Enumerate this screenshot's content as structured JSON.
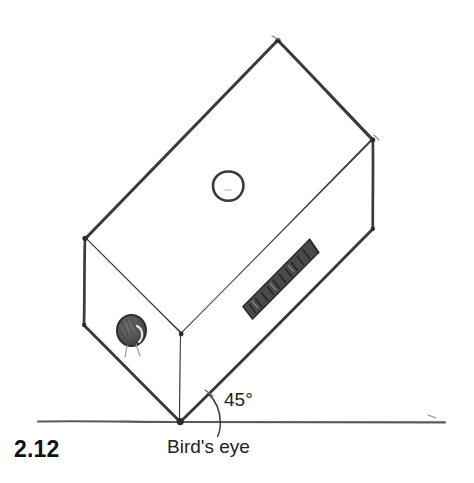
{
  "figure": {
    "number": "2.12",
    "caption": "Bird's eye",
    "angle_label": "45°",
    "style": "pencil sketch, grayscale line drawing"
  },
  "colors": {
    "background": "#ffffff",
    "ink": "#3a3a3a",
    "ink_dark": "#2b2b2b",
    "ground_line": "#5a5a5a",
    "hatch_fill": "#4a4a4a",
    "knob_fill": "#555555",
    "text": "#111111"
  },
  "geometry": {
    "apex_top": [
      278,
      40
    ],
    "right_top": [
      373,
      140
    ],
    "right_bottom": [
      373,
      229
    ],
    "bottom_tip": [
      180,
      422
    ],
    "front_middle": [
      181,
      334
    ],
    "left_top": [
      85,
      238
    ],
    "left_bottom": [
      84,
      325
    ],
    "ground_line": {
      "x1": 38,
      "x2": 445,
      "y": 422
    },
    "top_face_hole": {
      "cx": 228,
      "cy": 186,
      "r": 15
    },
    "front_face_knob": {
      "cx": 132,
      "cy": 331,
      "r": 14
    },
    "side_slot": [
      [
        243,
        306
      ],
      [
        252,
        319
      ],
      [
        318,
        252
      ],
      [
        309,
        240
      ]
    ],
    "angle_arc": {
      "cx": 180,
      "cy": 422,
      "r": 40,
      "from_deg": 0,
      "to_deg": -45
    }
  },
  "elements": {
    "top_face_name": "top-face",
    "front_face_name": "front-face",
    "side_face_name": "right-side-face",
    "hole_name": "top-face-hole",
    "knob_name": "front-face-knob",
    "slot_name": "side-face-vent-slot"
  }
}
